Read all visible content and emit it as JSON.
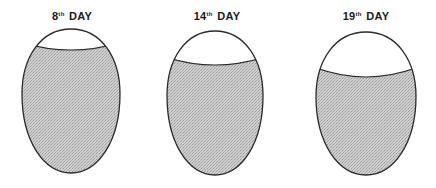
{
  "eggs": [
    {
      "day_number": "8",
      "ordinal": "th",
      "suffix": "DAY",
      "label_x": 72,
      "cx": 71,
      "top": 29,
      "bottom": 173,
      "rx": 49,
      "aircell_edge_y": 43,
      "aircell_center_y": 51
    },
    {
      "day_number": "14",
      "ordinal": "th",
      "suffix": "DAY",
      "label_x": 217,
      "cx": 215,
      "top": 31,
      "bottom": 175,
      "rx": 48,
      "aircell_edge_y": 58,
      "aircell_center_y": 66
    },
    {
      "day_number": "19",
      "ordinal": "th",
      "suffix": "DAY",
      "label_x": 366,
      "cx": 366,
      "top": 32,
      "bottom": 175,
      "rx": 50,
      "aircell_edge_y": 68,
      "aircell_center_y": 78
    }
  ],
  "colors": {
    "shell_outline": "#2a2a2a",
    "contents_fill": "#c8c8c8",
    "aircell_fill": "#ffffff"
  }
}
